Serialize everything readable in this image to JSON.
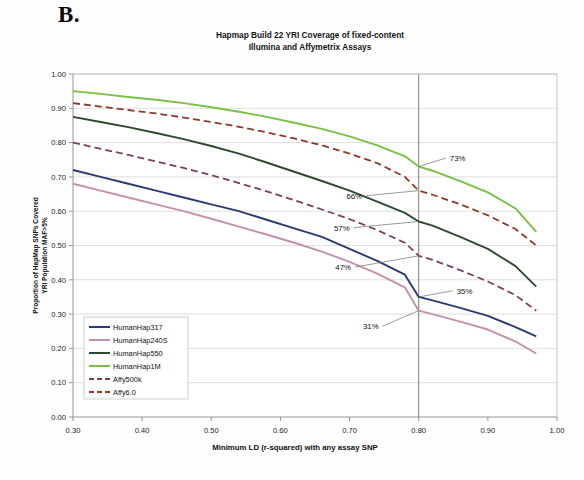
{
  "panel": {
    "letter": "B."
  },
  "chart_data": {
    "type": "line",
    "title": "Hapmap Build 22 YRI Coverage of fixed-content\nIllumina and Affymetrix Assays",
    "title_line1": "Hapmap Build 22 YRI Coverage of fixed-content",
    "title_line2": "Illumina and Affymetrix Assays",
    "xlabel": "Minimum LD (r-squared) with any assay SNP",
    "ylabel": "Proportion of HapMap SNPs  Covered",
    "ylabel_line1": "Proportion of HapMap SNPs  Covered",
    "ylabel_line2": "YRI Population MAF>5%",
    "xlim": [
      0.3,
      1.0
    ],
    "ylim": [
      0.0,
      1.0
    ],
    "xticks": [
      "0.30",
      "0.40",
      "0.50",
      "0.60",
      "0.70",
      "0.80",
      "0.90",
      "1.00"
    ],
    "xtick_values": [
      0.3,
      0.4,
      0.5,
      0.6,
      0.7,
      0.8,
      0.9,
      1.0
    ],
    "yticks": [
      "0.00",
      "0.10",
      "0.20",
      "0.30",
      "0.40",
      "0.50",
      "0.60",
      "0.70",
      "0.80",
      "0.90",
      "1.00"
    ],
    "ytick_values": [
      0.0,
      0.1,
      0.2,
      0.3,
      0.4,
      0.5,
      0.6,
      0.7,
      0.8,
      0.9,
      1.0
    ],
    "grid": true,
    "legend_position": "lower-left-inside",
    "reference_line_x": 0.8,
    "x": [
      0.3,
      0.34,
      0.38,
      0.42,
      0.46,
      0.5,
      0.54,
      0.58,
      0.62,
      0.66,
      0.7,
      0.74,
      0.78,
      0.8,
      0.82,
      0.86,
      0.9,
      0.94,
      0.97
    ],
    "series": [
      {
        "name": "HumanHap317",
        "color": "#2b3a72",
        "style": "solid",
        "value_at_080": 0.35,
        "values": [
          0.72,
          0.7,
          0.68,
          0.66,
          0.64,
          0.62,
          0.6,
          0.575,
          0.55,
          0.525,
          0.49,
          0.455,
          0.415,
          0.35,
          0.34,
          0.318,
          0.295,
          0.262,
          0.235
        ]
      },
      {
        "name": "HumanHap240S",
        "color": "#c58fae",
        "style": "solid",
        "value_at_080": 0.31,
        "values": [
          0.68,
          0.66,
          0.64,
          0.62,
          0.6,
          0.578,
          0.555,
          0.532,
          0.508,
          0.482,
          0.452,
          0.418,
          0.378,
          0.31,
          0.3,
          0.278,
          0.255,
          0.22,
          0.185
        ]
      },
      {
        "name": "HumanHap550",
        "color": "#2c4a2e",
        "style": "solid",
        "value_at_080": 0.57,
        "values": [
          0.875,
          0.86,
          0.845,
          0.828,
          0.81,
          0.79,
          0.768,
          0.742,
          0.715,
          0.688,
          0.66,
          0.628,
          0.595,
          0.57,
          0.558,
          0.525,
          0.49,
          0.44,
          0.38
        ]
      },
      {
        "name": "HumanHap1M",
        "color": "#79c043",
        "style": "solid",
        "value_at_080": 0.73,
        "values": [
          0.95,
          0.942,
          0.933,
          0.925,
          0.915,
          0.903,
          0.89,
          0.875,
          0.858,
          0.84,
          0.818,
          0.792,
          0.76,
          0.73,
          0.718,
          0.688,
          0.655,
          0.608,
          0.54
        ]
      },
      {
        "name": "Affy500k",
        "color": "#7c3f66",
        "style": "dashed",
        "value_at_080": 0.47,
        "values": [
          0.8,
          0.782,
          0.764,
          0.745,
          0.726,
          0.705,
          0.682,
          0.658,
          0.632,
          0.605,
          0.577,
          0.545,
          0.508,
          0.47,
          0.458,
          0.428,
          0.395,
          0.355,
          0.31
        ]
      },
      {
        "name": "Affy6.0",
        "color": "#8e3a2a",
        "style": "dashed",
        "value_at_080": 0.66,
        "values": [
          0.915,
          0.905,
          0.895,
          0.885,
          0.873,
          0.86,
          0.846,
          0.83,
          0.812,
          0.792,
          0.768,
          0.74,
          0.7,
          0.66,
          0.648,
          0.62,
          0.588,
          0.548,
          0.5
        ]
      }
    ],
    "annotations": [
      {
        "label": "73%",
        "series": "HumanHap1M",
        "x": 0.8,
        "y": 0.73,
        "label_x": 0.845,
        "label_y": 0.755
      },
      {
        "label": "66%",
        "series": "Affy6.0",
        "x": 0.8,
        "y": 0.66,
        "label_x": 0.718,
        "label_y": 0.645
      },
      {
        "label": "57%",
        "series": "HumanHap550",
        "x": 0.8,
        "y": 0.57,
        "label_x": 0.7,
        "label_y": 0.552
      },
      {
        "label": "47%",
        "series": "Affy500k",
        "x": 0.8,
        "y": 0.47,
        "label_x": 0.702,
        "label_y": 0.437
      },
      {
        "label": "35%",
        "series": "HumanHap317",
        "x": 0.8,
        "y": 0.35,
        "label_x": 0.855,
        "label_y": 0.368
      },
      {
        "label": "31%",
        "series": "HumanHap240S",
        "x": 0.8,
        "y": 0.31,
        "label_x": 0.742,
        "label_y": 0.265
      }
    ],
    "legend": [
      {
        "label": "HumanHap317",
        "color": "#2b3a72",
        "style": "solid"
      },
      {
        "label": "HumanHap240S",
        "color": "#c58fae",
        "style": "solid"
      },
      {
        "label": "HumanHap550",
        "color": "#2c4a2e",
        "style": "solid"
      },
      {
        "label": "HumanHap1M",
        "color": "#79c043",
        "style": "solid"
      },
      {
        "label": "Affy500k",
        "color": "#7c3f66",
        "style": "dashed"
      },
      {
        "label": "Affy6.0",
        "color": "#8e3a2a",
        "style": "dashed"
      }
    ]
  }
}
